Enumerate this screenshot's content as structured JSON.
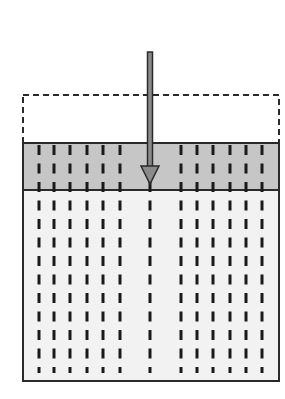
{
  "diagram": {
    "colors": {
      "background": "#ffffff",
      "outline": "#2a2a2a",
      "compressed_layer_fill": "#c6c6c6",
      "body_fill": "#f2f2f2",
      "arrow_fill": "#8a8a8a",
      "arrow_stroke": "#2a2a2a",
      "dash_color": "#1a1a1a"
    },
    "original_outline": {
      "x": 23,
      "y": 95,
      "width": 256,
      "height": 48,
      "style": "dashed"
    },
    "compressed_layer": {
      "x": 23,
      "y": 143,
      "width": 256,
      "height": 47
    },
    "body": {
      "x": 23,
      "y": 190,
      "width": 256,
      "height": 191
    },
    "fiber_lines_x": [
      39,
      54,
      70,
      87,
      103,
      120,
      150,
      181,
      197,
      213,
      230,
      246,
      262
    ],
    "arrow": {
      "x": 150,
      "y_start": 52,
      "y_tip": 184,
      "direction": "down",
      "label": ""
    }
  }
}
